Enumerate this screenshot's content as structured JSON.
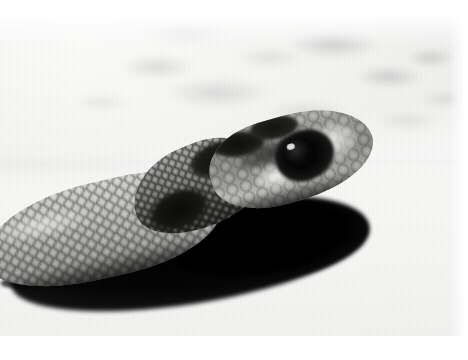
{
  "photo": {
    "subject": "snake-head",
    "description": "Black and white photograph of a snake's head resting on sand, viewed in profile from the left, with a strong dark cast shadow beneath it",
    "medium": "black-and-white photographic print",
    "orientation": "landscape",
    "border": "white photographic paper margin",
    "caption": "",
    "alt_text": "Close-up black and white photograph of a snake's head and neck on pale sand with a dark cast shadow"
  },
  "frame": {
    "paper_color": "#ffffff",
    "print_left": 0,
    "print_top": 16,
    "print_width": 463,
    "print_height": 320
  },
  "palette": {
    "paper_white": "#ffffff",
    "sand_light": "#f8f8f7",
    "background_grey": "#ebebea",
    "scale_midtone": "#a0a09e",
    "scale_highlight": "#d4d4d2",
    "marking_dark": "#1a1a18",
    "shadow_black": "#000000",
    "eye_black": "#050505"
  },
  "regions": [
    {
      "id": "background",
      "label": "Out-of-focus pale sand and rock background"
    },
    {
      "id": "sand-foreground",
      "label": "Speckled sunlit sand foreground"
    },
    {
      "id": "cast-shadow",
      "label": "Dark cast shadow beneath snake"
    },
    {
      "id": "snake-body",
      "label": "Scaled snake body entering from lower left"
    },
    {
      "id": "snake-neck",
      "label": "Dark blotched neck markings"
    },
    {
      "id": "snake-head",
      "label": "Snake head with banded crown pattern"
    },
    {
      "id": "snake-eye",
      "label": "Dark eye with specular highlight"
    },
    {
      "id": "snake-snout",
      "label": "Rounded pale snout tip"
    }
  ]
}
